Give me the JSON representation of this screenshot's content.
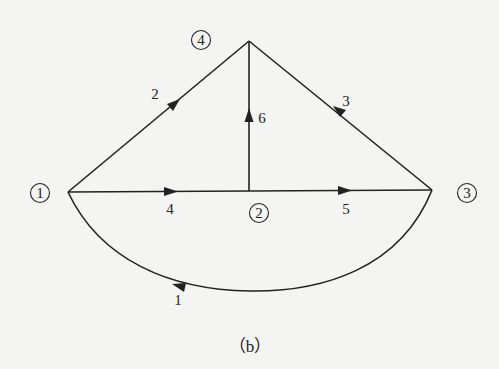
{
  "diagram": {
    "caption": "（b）",
    "colors": {
      "ink": "#222222",
      "paper": "#f4f4f2"
    },
    "nodes": [
      {
        "id": "1",
        "label": "1",
        "x": 68,
        "y": 192,
        "label_x": 40,
        "label_y": 193
      },
      {
        "id": "2",
        "label": "2",
        "x": 250,
        "y": 191,
        "label_x": 259,
        "label_y": 213
      },
      {
        "id": "3",
        "label": "3",
        "x": 432,
        "y": 190,
        "label_x": 467,
        "label_y": 193
      },
      {
        "id": "4",
        "label": "4",
        "x": 249,
        "y": 41,
        "label_x": 201,
        "label_y": 40
      }
    ],
    "edges": [
      {
        "id": "1",
        "label": "1",
        "from": "3",
        "to": "1",
        "shape": "curve",
        "label_x": 178,
        "label_y": 300
      },
      {
        "id": "2",
        "label": "2",
        "from": "1",
        "to": "4",
        "shape": "line",
        "label_x": 155,
        "label_y": 94
      },
      {
        "id": "3",
        "label": "3",
        "from": "3",
        "to": "4",
        "shape": "line",
        "label_x": 346,
        "label_y": 101
      },
      {
        "id": "4",
        "label": "4",
        "from": "1",
        "to": "2",
        "shape": "line",
        "label_x": 170,
        "label_y": 209
      },
      {
        "id": "5",
        "label": "5",
        "from": "2",
        "to": "3",
        "shape": "line",
        "label_x": 346,
        "label_y": 209
      },
      {
        "id": "6",
        "label": "6",
        "from": "2",
        "to": "4",
        "shape": "line",
        "label_x": 262,
        "label_y": 118
      }
    ]
  }
}
